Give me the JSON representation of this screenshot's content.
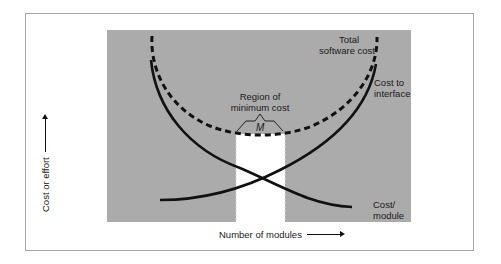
{
  "figure": {
    "y_axis_label": "Cost or effort",
    "x_axis_label": "Number of modules",
    "curves": {
      "total": "Total software cost",
      "total_line1": "Total",
      "total_line2": "software cost",
      "interface_line1": "Cost to",
      "interface_line2": "interface",
      "module_line1": "Cost/",
      "module_line2": "module"
    },
    "region": {
      "line1": "Region of",
      "line2": "minimum cost",
      "symbol": "M"
    }
  },
  "colors": {
    "panel": "#ababab",
    "frame": "#a8a8a8",
    "curve": "#111111",
    "region": "#ffffff"
  }
}
